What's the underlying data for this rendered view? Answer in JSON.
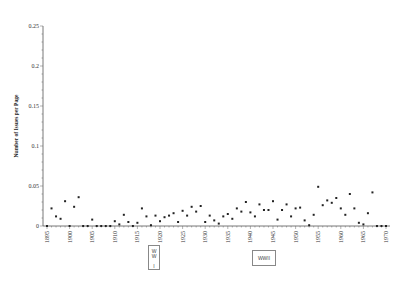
{
  "chart_data": {
    "type": "scatter",
    "title": "",
    "xlabel": "",
    "ylabel": "Number of Issues per Page",
    "xlim": [
      1895,
      1970
    ],
    "ylim": [
      0,
      0.25
    ],
    "grid": false,
    "legend": null,
    "x_ticks": [
      1895,
      1900,
      1905,
      1910,
      1915,
      1920,
      1925,
      1930,
      1935,
      1940,
      1945,
      1950,
      1955,
      1960,
      1965,
      1970
    ],
    "y_ticks": [
      0,
      0.05,
      0.1,
      0.15,
      0.2,
      0.25
    ],
    "y_tick_labels": [
      "0",
      "0.05",
      "0.1",
      "0.15",
      "0.2",
      "0.25"
    ],
    "annotations": [
      {
        "label": "WW I",
        "x_start": 1914,
        "x_end": 1918
      },
      {
        "label": "WWII",
        "x_start": 1939,
        "x_end": 1945
      }
    ],
    "series": [
      {
        "name": "Issues per page",
        "x": [
          1895,
          1896,
          1897,
          1898,
          1899,
          1900,
          1901,
          1902,
          1903,
          1904,
          1905,
          1906,
          1907,
          1908,
          1909,
          1910,
          1911,
          1912,
          1913,
          1914,
          1915,
          1916,
          1917,
          1918,
          1919,
          1920,
          1921,
          1922,
          1923,
          1924,
          1925,
          1926,
          1927,
          1928,
          1929,
          1930,
          1931,
          1932,
          1933,
          1934,
          1935,
          1936,
          1937,
          1938,
          1939,
          1940,
          1941,
          1942,
          1943,
          1944,
          1945,
          1946,
          1947,
          1948,
          1949,
          1950,
          1951,
          1952,
          1953,
          1954,
          1955,
          1956,
          1957,
          1958,
          1959,
          1960,
          1961,
          1962,
          1963,
          1964,
          1965,
          1966,
          1967,
          1968,
          1969,
          1970
        ],
        "values": [
          0,
          0.022,
          0.012,
          0.009,
          0.031,
          0,
          0.024,
          0.036,
          0,
          0,
          0.008,
          0,
          0,
          0,
          0,
          0.006,
          0.002,
          0.014,
          0.005,
          0,
          0.004,
          0.022,
          0.012,
          0.001,
          0.013,
          0.006,
          0.011,
          0.013,
          0.016,
          0.005,
          0.019,
          0.013,
          0.024,
          0.018,
          0.025,
          0.005,
          0.013,
          0.007,
          0.003,
          0.012,
          0.015,
          0.009,
          0.022,
          0.018,
          0.03,
          0.017,
          0.012,
          0.027,
          0.02,
          0.02,
          0.031,
          0.008,
          0.02,
          0.027,
          0.012,
          0.022,
          0.023,
          0.007,
          0.001,
          0.014,
          0.049,
          0.026,
          0.032,
          0.029,
          0.035,
          0.022,
          0.014,
          0.04,
          0.022,
          0.004,
          0.002,
          0.016,
          0.042,
          0,
          0,
          0
        ]
      }
    ]
  }
}
